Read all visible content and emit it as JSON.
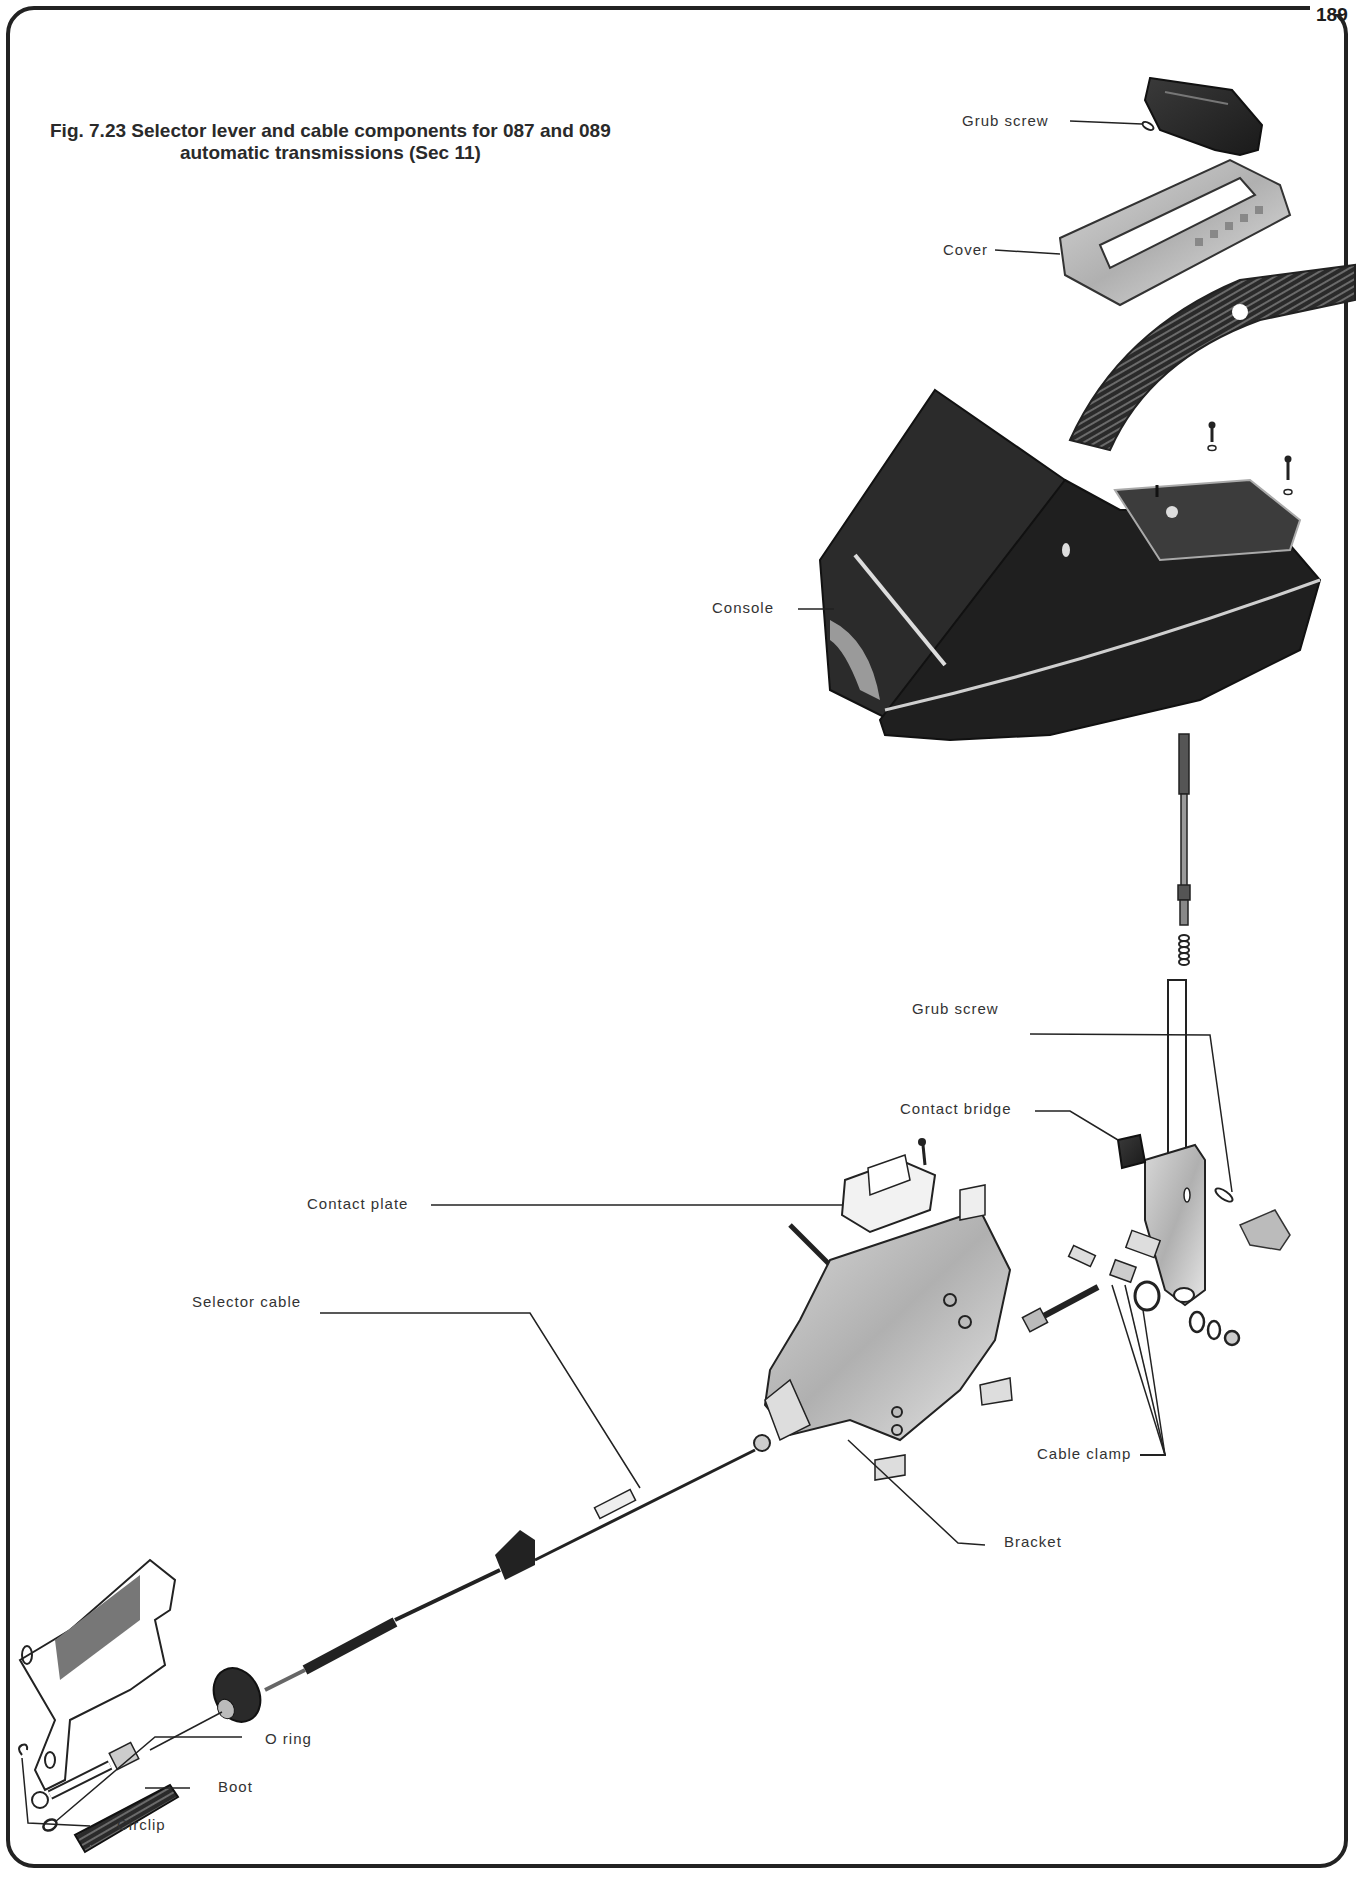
{
  "page": {
    "number": "189"
  },
  "figure": {
    "caption_line1": "Fig. 7.23 Selector lever and cable components for 087 and 089",
    "caption_line2": "automatic transmissions (Sec 11)"
  },
  "labels": {
    "grub_screw_top": "Grub screw",
    "cover": "Cover",
    "console": "Console",
    "grub_screw_lower": "Grub screw",
    "contact_bridge": "Contact bridge",
    "contact_plate": "Contact plate",
    "selector_cable": "Selector cable",
    "cable_clamp": "Cable clamp",
    "bracket": "Bracket",
    "o_ring": "O ring",
    "boot": "Boot",
    "circlip": "Circlip"
  },
  "parts": [
    "selector-lever-handle",
    "grub-screw",
    "cover",
    "slider-strip",
    "console",
    "selector-lever-shaft",
    "spring",
    "lever-tube",
    "contact-bridge",
    "contact-plate",
    "bracket",
    "cable-clamp",
    "selector-cable",
    "cable-mounting-bracket",
    "o-ring",
    "boot",
    "circlip"
  ]
}
